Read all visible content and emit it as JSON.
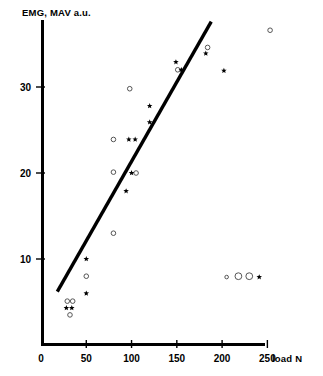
{
  "chart_data": {
    "type": "scatter",
    "title": "",
    "ylabel": "EMG, MAV a.u.",
    "xlabel": "load N",
    "xlim": [
      0,
      262
    ],
    "ylim": [
      0,
      39
    ],
    "grid": false,
    "legend": "none",
    "xticks": [
      0,
      50,
      100,
      150,
      200,
      250
    ],
    "xtick_labels": [
      "0",
      "50",
      "100",
      "150",
      "200",
      "250"
    ],
    "yticks": [
      10,
      20,
      30
    ],
    "ytick_labels": [
      "10",
      "20",
      "30"
    ],
    "series": [
      {
        "name": "open-circle",
        "marker": "circle",
        "color": "#555555",
        "points": [
          {
            "x": 29,
            "y": 5.1,
            "r": 2.3
          },
          {
            "x": 35,
            "y": 5.1,
            "r": 2.3
          },
          {
            "x": 32,
            "y": 3.5,
            "r": 2.3
          },
          {
            "x": 50,
            "y": 8.0,
            "r": 2.3
          },
          {
            "x": 80,
            "y": 13.0,
            "r": 2.3
          },
          {
            "x": 80,
            "y": 20.1,
            "r": 2.3
          },
          {
            "x": 105,
            "y": 20.0,
            "r": 2.3
          },
          {
            "x": 80,
            "y": 23.9,
            "r": 2.3
          },
          {
            "x": 98,
            "y": 29.8,
            "r": 2.3
          },
          {
            "x": 151,
            "y": 32.0,
            "r": 2.3
          },
          {
            "x": 184,
            "y": 34.6,
            "r": 2.3
          },
          {
            "x": 253,
            "y": 36.6,
            "r": 2.3
          },
          {
            "x": 205,
            "y": 7.9,
            "r": 1.8
          },
          {
            "x": 218,
            "y": 8.0,
            "r": 3.4
          },
          {
            "x": 230,
            "y": 8.0,
            "r": 3.4
          }
        ]
      },
      {
        "name": "filled-star",
        "marker": "star",
        "color": "#000000",
        "points": [
          {
            "x": 28,
            "y": 4.3
          },
          {
            "x": 34,
            "y": 4.3
          },
          {
            "x": 50,
            "y": 6.0
          },
          {
            "x": 50,
            "y": 10.0
          },
          {
            "x": 94,
            "y": 17.9
          },
          {
            "x": 100,
            "y": 20.0
          },
          {
            "x": 97,
            "y": 23.9
          },
          {
            "x": 104,
            "y": 23.9
          },
          {
            "x": 120,
            "y": 25.9
          },
          {
            "x": 120,
            "y": 27.8
          },
          {
            "x": 149,
            "y": 32.9
          },
          {
            "x": 155,
            "y": 32.0
          },
          {
            "x": 182,
            "y": 33.9
          },
          {
            "x": 202,
            "y": 31.9
          },
          {
            "x": 241,
            "y": 7.9
          }
        ]
      }
    ],
    "trend_line": {
      "name": "regression-line",
      "x_start": 18,
      "y_start": 6.2,
      "x_end": 188,
      "y_end": 37.6
    }
  }
}
